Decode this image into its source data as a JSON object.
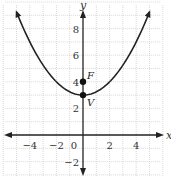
{
  "chart_data": {
    "type": "line",
    "title": "",
    "xlabel": "x",
    "ylabel": "y",
    "xlim": [
      -6,
      6
    ],
    "ylim": [
      -3,
      10
    ],
    "grid": true,
    "x_ticks": [
      {
        "value": -4,
        "label": "−4"
      },
      {
        "value": -2,
        "label": "−2"
      },
      {
        "value": 0,
        "label": "0"
      },
      {
        "value": 2,
        "label": "2"
      },
      {
        "value": 4,
        "label": "4"
      }
    ],
    "y_ticks": [
      {
        "value": 8,
        "label": "8"
      },
      {
        "value": 6,
        "label": "6"
      },
      {
        "value": 4,
        "label": "4"
      },
      {
        "value": 2,
        "label": "2"
      },
      {
        "value": -2,
        "label": "−2"
      }
    ],
    "series": [
      {
        "name": "parabola",
        "equation": "y = x^2/4 + 3",
        "x": [
          -5,
          -4,
          -3,
          -2,
          -1,
          0,
          1,
          2,
          3,
          4,
          5
        ],
        "y": [
          9.25,
          7,
          5.25,
          4,
          3.25,
          3,
          3.25,
          4,
          5.25,
          7,
          9.25
        ]
      }
    ],
    "points": [
      {
        "label": "F",
        "x": 0,
        "y": 4
      },
      {
        "label": "V",
        "x": 0,
        "y": 3
      }
    ]
  },
  "labels": {
    "x_axis": "x",
    "y_axis": "y",
    "origin": "0",
    "focus": "F",
    "vertex": "V"
  }
}
